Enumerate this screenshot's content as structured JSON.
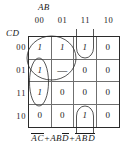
{
  "figure": {
    "type": "karnaugh-map",
    "top_variable_label": "AB",
    "left_variable_label": "CD",
    "column_headers": [
      "00",
      "01",
      "11",
      "10"
    ],
    "row_headers": [
      "00",
      "01",
      "11",
      "10"
    ],
    "cells": [
      [
        "1",
        "1",
        "1",
        "0"
      ],
      [
        "1",
        "—",
        "0",
        "0"
      ],
      [
        "1",
        "0",
        "0",
        "0"
      ],
      [
        "0",
        "0",
        "1",
        "0"
      ]
    ],
    "grid_line_color": "#6f6f6f",
    "border_color": "#2b2b2b",
    "ink_color": "#1a1a1a"
  },
  "expression": {
    "full_text": "AC + ABD + ABD",
    "terms": [
      {
        "literals": [
          {
            "text": "A",
            "bar": true
          },
          {
            "text": "C",
            "bar": true
          }
        ]
      },
      {
        "literals": [
          {
            "text": "A",
            "bar": false
          },
          {
            "text": "B",
            "bar": false
          },
          {
            "text": "D",
            "bar": true
          }
        ]
      },
      {
        "literals": [
          {
            "text": "A",
            "bar": true
          },
          {
            "text": "B",
            "bar": true
          },
          {
            "text": "D",
            "bar": true
          }
        ]
      }
    ],
    "operator": "+",
    "term1_l1": "A",
    "term1_l2": "C",
    "term2_l1": "AB",
    "term2_l2": "D",
    "term3_l1": "A",
    "term3_l2": "B",
    "term3_l3": "D",
    "op1": "+",
    "op2": "+"
  },
  "groups": [
    {
      "name": "group-large-quad",
      "shape": "ellipse",
      "cells": [
        "r0c0",
        "r0c1",
        "r1c0",
        "r1c1"
      ]
    },
    {
      "name": "group-tall-column",
      "shape": "ellipse",
      "cells": [
        "r0c0",
        "r1c0",
        "r2c0"
      ]
    },
    {
      "name": "group-wrap-top",
      "shape": "half-ellipse",
      "cells": [
        "r0c2"
      ]
    },
    {
      "name": "group-wrap-bottom",
      "shape": "half-ellipse",
      "cells": [
        "r3c2"
      ]
    }
  ]
}
